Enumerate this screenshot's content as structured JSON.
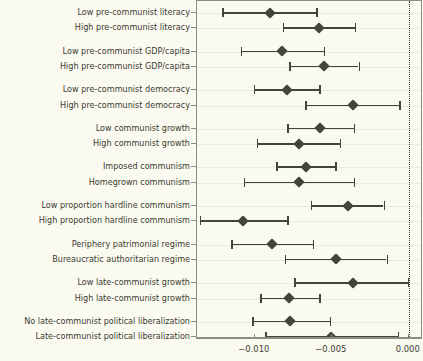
{
  "chart_data": {
    "type": "scatter",
    "subtype": "coefficient-forest-plot",
    "title": "",
    "subtitle": "",
    "xlabel": "",
    "ylabel": "",
    "xlim": [
      -0.01375,
      0.00092
    ],
    "grid": true,
    "legend": "none",
    "orientation": "horizontal",
    "reference_line": {
      "value": 0.0,
      "style": "dotted"
    },
    "xticks": [
      -0.01,
      -0.005,
      0.0
    ],
    "xticklabels": [
      "−0.010",
      "−0.005",
      "0.000"
    ],
    "marker": "diamond",
    "marker_color": "#44443c",
    "line_color": "#44443c",
    "background_color": "#fbfaf0",
    "frame_color": "#8c8c80",
    "categories": [
      "Low pre-communist literacy",
      "High pre-communist literacy",
      "Low pre-communist GDP/capita",
      "High pre-communist GDP/capita",
      "Low pre-communist democracy",
      "High pre-communist democracy",
      "Low communist growth",
      "High communist growth",
      "Imposed communism",
      "Homegrown communism",
      "Low proportion hardline communism",
      "High proportion hardline communism",
      "Periphery patrimonial regime",
      "Bureaucratic authoritarian regime",
      "Low late-communist growth",
      "High late-communist growth",
      "No late-communist political liberalization",
      "Late-communist political liberalization"
    ],
    "groups": [
      {
        "name": "Pre-communist literacy",
        "rows": [
          0,
          1
        ]
      },
      {
        "name": "Pre-communist GDP/capita",
        "rows": [
          2,
          3
        ]
      },
      {
        "name": "Pre-communist democracy",
        "rows": [
          4,
          5
        ]
      },
      {
        "name": "Communist growth",
        "rows": [
          6,
          7
        ]
      },
      {
        "name": "Origin of communism",
        "rows": [
          8,
          9
        ]
      },
      {
        "name": "Proportion hardline communism",
        "rows": [
          10,
          11
        ]
      },
      {
        "name": "Regime type",
        "rows": [
          12,
          13
        ]
      },
      {
        "name": "Late-communist growth",
        "rows": [
          14,
          15
        ]
      },
      {
        "name": "Late-communist political liberalization",
        "rows": [
          16,
          17
        ]
      }
    ],
    "estimates": [
      {
        "label": "Low pre-communist literacy",
        "value": -0.00903,
        "ci_low": -0.01212,
        "ci_high": -0.006
      },
      {
        "label": "High pre-communist literacy",
        "value": -0.00582,
        "ci_low": -0.00818,
        "ci_high": -0.00352
      },
      {
        "label": "Low pre-communist GDP/capita",
        "value": -0.00824,
        "ci_low": -0.01091,
        "ci_high": -0.00552
      },
      {
        "label": "High pre-communist GDP/capita",
        "value": -0.00552,
        "ci_low": -0.00776,
        "ci_high": -0.00327
      },
      {
        "label": "Low pre-communist democracy",
        "value": -0.00794,
        "ci_low": -0.01006,
        "ci_high": -0.00582
      },
      {
        "label": "High pre-communist democracy",
        "value": -0.00364,
        "ci_low": -0.00673,
        "ci_high": -0.00061
      },
      {
        "label": "Low communist growth",
        "value": -0.00576,
        "ci_low": -0.00788,
        "ci_high": -0.00358
      },
      {
        "label": "High communist growth",
        "value": -0.00715,
        "ci_low": -0.00988,
        "ci_high": -0.00448
      },
      {
        "label": "Imposed communism",
        "value": -0.00667,
        "ci_low": -0.00861,
        "ci_high": -0.00479
      },
      {
        "label": "Homegrown communism",
        "value": -0.00715,
        "ci_low": -0.01073,
        "ci_high": -0.00358
      },
      {
        "label": "Low proportion hardline communism",
        "value": -0.00394,
        "ci_low": -0.00636,
        "ci_high": -0.00164
      },
      {
        "label": "High proportion hardline communism",
        "value": -0.01079,
        "ci_low": -0.01358,
        "ci_high": -0.00788
      },
      {
        "label": "Periphery patrimonial regime",
        "value": -0.00891,
        "ci_low": -0.01152,
        "ci_high": -0.00624
      },
      {
        "label": "Bureaucratic authoritarian regime",
        "value": -0.00473,
        "ci_low": -0.00806,
        "ci_high": -0.00145
      },
      {
        "label": "Low late-communist growth",
        "value": -0.00364,
        "ci_low": -0.00745,
        "ci_high": -6e-05
      },
      {
        "label": "High late-communist growth",
        "value": -0.00776,
        "ci_low": -0.00964,
        "ci_high": -0.00582
      },
      {
        "label": "No late-communist political liberalization",
        "value": -0.0077,
        "ci_low": -0.01018,
        "ci_high": -0.00515
      },
      {
        "label": "Late-communist political liberalization",
        "value": -0.00503,
        "ci_low": -0.00933,
        "ci_high": -0.00073
      }
    ]
  }
}
